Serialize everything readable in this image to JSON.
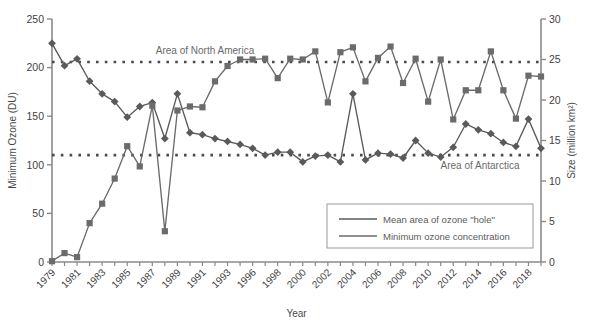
{
  "chart_data": {
    "type": "line",
    "title": "",
    "xlabel": "Year",
    "ylabel": "Minimum Ozone (DU)",
    "y2label": "Size (million km²)",
    "ylim": [
      0,
      250
    ],
    "y2lim": [
      0,
      30
    ],
    "grid": false,
    "legend_position": "bottom-right",
    "x": [
      1979,
      1980,
      1981,
      1982,
      1983,
      1984,
      1985,
      1986,
      1987,
      1988,
      1989,
      1990,
      1991,
      1992,
      1993,
      1994,
      1995,
      1996,
      1997,
      1998,
      1999,
      2000,
      2001,
      2002,
      2003,
      2004,
      2005,
      2006,
      2007,
      2008,
      2009,
      2010,
      2011,
      2012,
      2013,
      2014,
      2015,
      2016,
      2017,
      2018
    ],
    "xtick_labels": [
      "1979",
      "1981",
      "1983",
      "1985",
      "1987",
      "1989",
      "1991",
      "1993",
      "1996",
      "1998",
      "2000",
      "2002",
      "2004",
      "2006",
      "2008",
      "2010",
      "2012",
      "2014",
      "2016",
      "2018"
    ],
    "ytick_labels": [
      "0",
      "50",
      "100",
      "150",
      "200",
      "250"
    ],
    "y2tick_labels": [
      "0",
      "5",
      "10",
      "15",
      "20",
      "25",
      "30"
    ],
    "series": [
      {
        "name": "Minimum ozone concentration",
        "axis": "left",
        "unit": "DU",
        "marker": "diamond",
        "color": "#5a5a5a",
        "values": [
          225,
          202,
          209,
          186,
          173,
          165,
          149,
          160,
          164,
          127,
          173,
          133,
          131,
          127,
          124,
          121,
          117,
          110,
          113,
          113,
          103,
          109,
          110,
          103,
          173,
          105,
          112,
          111,
          107,
          125,
          112,
          108,
          118,
          142,
          136,
          132,
          123,
          119,
          147,
          117
        ]
      },
      {
        "name": "Mean area of ozone \"hole\"",
        "axis": "right",
        "unit": "million km²",
        "marker": "square",
        "color": "#6b6b6b",
        "values": [
          0.1,
          1.1,
          0.6,
          4.8,
          7.2,
          10.3,
          14.3,
          11.8,
          19.3,
          3.8,
          18.7,
          19.2,
          19.1,
          22.3,
          24.2,
          25.0,
          25.0,
          25.1,
          22.7,
          25.1,
          25.0,
          26.0,
          19.7,
          25.9,
          26.5,
          22.3,
          25.2,
          26.6,
          22.1,
          25.1,
          19.8,
          25.0,
          17.6,
          21.2,
          21.2,
          26.0,
          21.2,
          17.7,
          23.0,
          22.9
        ]
      }
    ],
    "reference_lines": [
      {
        "label": "Area of North America",
        "value": 24.7,
        "axis": "right",
        "style": "dotted"
      },
      {
        "label": "Area of Antarctica",
        "value": 13.2,
        "axis": "right",
        "style": "dotted"
      }
    ]
  },
  "axes": {
    "y_left_title": "Minimum Ozone (DU)",
    "y_right_title": "Size (million km²)",
    "x_title": "Year"
  },
  "legend": {
    "items": [
      {
        "label": "Mean area of ozone \"hole\""
      },
      {
        "label": "Minimum ozone concentration"
      }
    ]
  },
  "annotations": {
    "north_america": "Area of North America",
    "antarctica": "Area of Antarctica"
  },
  "colors": {
    "line_area": "#6b6b6b",
    "line_ozone": "#5a5a5a",
    "axis": "#8a8a8a",
    "text": "#3f3f3f",
    "annotation": "#6a6a6a"
  }
}
